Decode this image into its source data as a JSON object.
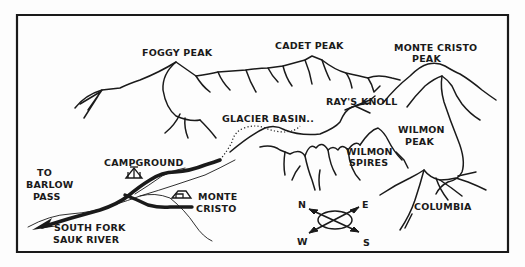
{
  "map": {
    "colors": {
      "ink": "#1a1a1a",
      "paper": "#fdfdfd"
    },
    "peaks": [
      {
        "name": "FOGGY PEAK"
      },
      {
        "name": "CADET PEAK"
      },
      {
        "name": "MONTE CRISTO",
        "name2": "PEAK"
      },
      {
        "name": "RAY'S KNOLL"
      },
      {
        "name": "WILMON",
        "name2": "PEAK"
      },
      {
        "name": "WILMON",
        "name2": "SPIRES"
      },
      {
        "name": "COLUMBIA"
      }
    ],
    "features": {
      "glacier_basin": "GLACIER BASIN..",
      "campground": "CAMPGROUND",
      "town_line1": "MONTE",
      "town_line2": "CRISTO",
      "to_line1": "TO",
      "to_line2": "BARLOW",
      "to_line3": "PASS",
      "river_line1": "SOUTH FORK",
      "river_line2": "SAUK RIVER"
    },
    "compass": {
      "n": "N",
      "e": "E",
      "w": "W",
      "s": "S"
    }
  }
}
